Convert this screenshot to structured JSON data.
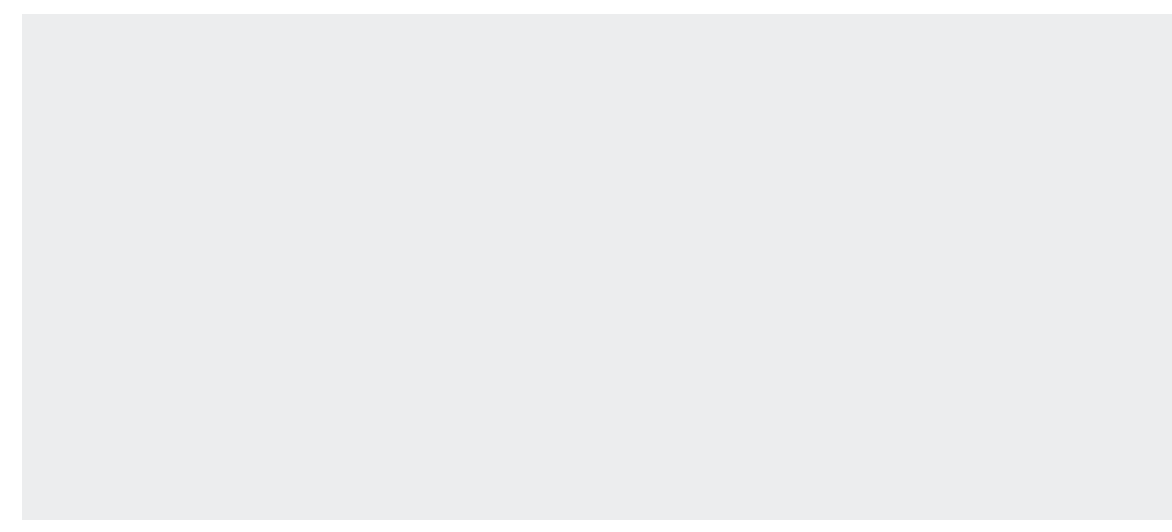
{
  "chart_data": {
    "type": "line",
    "title": "",
    "xlabel": "Hourly rate of pay",
    "ylabel": "Thousands",
    "ylim": [
      0,
      4000
    ],
    "yticks": [
      0,
      500,
      1000,
      1500,
      2000,
      2500,
      3000,
      3500,
      4000
    ],
    "ytick_labels": [
      "0",
      "500",
      "1,000",
      "1,500",
      "2,000",
      "2,500",
      "3,000",
      "3,500",
      "4,000"
    ],
    "x": [
      3.0,
      3.1,
      3.2,
      3.3,
      3.4,
      3.5,
      3.6,
      3.7,
      3.8,
      3.9,
      4.0,
      4.1,
      4.2,
      4.3,
      4.4,
      4.5
    ],
    "categories": [
      "£3.00",
      "£3.10",
      "£3.20",
      "£3.30",
      "£3.40",
      "£3.50",
      "£3.60",
      "£3.70",
      "£3.80",
      "£3.90",
      "£4.00",
      "£4.10",
      "£4.20",
      "£4.30",
      "£4.40",
      "£4.50"
    ],
    "grid": false,
    "legend_position": "top-left",
    "series": [
      {
        "name": "spring 1999",
        "style": "solid",
        "color": "#8c8c8c",
        "width": 6,
        "values": [
          190,
          230,
          265,
          300,
          340,
          385,
          420,
          560,
          1230,
          1480,
          1700,
          2040,
          2560,
          2620,
          2950,
          3300
        ]
      },
      {
        "name": "spring 2000",
        "style": "dashed-thin",
        "color": "#8c8c8c",
        "width": 3,
        "values": [
          120,
          135,
          150,
          160,
          170,
          185,
          200,
          230,
          780,
          900,
          1110,
          1320,
          1520,
          2040,
          2230,
          2480
        ]
      },
      {
        "name": "spring 2001",
        "style": "dashed-thick",
        "color": "#8c8c8c",
        "width": 6,
        "values": [
          110,
          118,
          125,
          132,
          140,
          150,
          160,
          185,
          250,
          560,
          790,
          950,
          1090,
          1500,
          1560,
          1760
        ]
      },
      {
        "name": "spring 2002",
        "style": "dash-dot",
        "color": "#8c8c8c",
        "width": 3,
        "values": [
          105,
          108,
          112,
          116,
          120,
          124,
          130,
          140,
          150,
          155,
          165,
          175,
          195,
          380,
          960,
          1180
        ]
      }
    ],
    "series_full": [
      {
        "name": "spring 1999",
        "points": [
          [
            3.0,
            190
          ],
          [
            3.1,
            230
          ],
          [
            3.2,
            265
          ],
          [
            3.3,
            300
          ],
          [
            3.4,
            340
          ],
          [
            3.5,
            385
          ],
          [
            3.55,
            420
          ],
          [
            3.6,
            560
          ],
          [
            3.7,
            1230
          ],
          [
            3.8,
            1480
          ],
          [
            3.9,
            1700
          ],
          [
            4.0,
            2040
          ],
          [
            4.05,
            2560
          ],
          [
            4.1,
            2620
          ],
          [
            4.2,
            2950
          ],
          [
            4.3,
            3300
          ],
          [
            4.4,
            3640
          ],
          [
            4.5,
            3975
          ]
        ]
      },
      {
        "name": "spring 2000",
        "points": [
          [
            3.0,
            120
          ],
          [
            3.1,
            135
          ],
          [
            3.2,
            150
          ],
          [
            3.3,
            160
          ],
          [
            3.4,
            170
          ],
          [
            3.5,
            185
          ],
          [
            3.55,
            200
          ],
          [
            3.6,
            230
          ],
          [
            3.7,
            780
          ],
          [
            3.8,
            900
          ],
          [
            3.9,
            1110
          ],
          [
            4.0,
            1320
          ],
          [
            4.02,
            1520
          ],
          [
            4.1,
            2040
          ],
          [
            4.2,
            2230
          ],
          [
            4.3,
            2480
          ],
          [
            4.4,
            2880
          ],
          [
            4.5,
            3340
          ]
        ]
      },
      {
        "name": "spring 2001",
        "points": [
          [
            3.0,
            110
          ],
          [
            3.1,
            118
          ],
          [
            3.2,
            125
          ],
          [
            3.3,
            132
          ],
          [
            3.4,
            140
          ],
          [
            3.5,
            150
          ],
          [
            3.6,
            160
          ],
          [
            3.65,
            185
          ],
          [
            3.7,
            250
          ],
          [
            3.8,
            560
          ],
          [
            3.9,
            790
          ],
          [
            4.0,
            950
          ],
          [
            4.05,
            1090
          ],
          [
            4.1,
            1500
          ],
          [
            4.2,
            1560
          ],
          [
            4.3,
            1760
          ],
          [
            4.4,
            2150
          ],
          [
            4.5,
            2600
          ]
        ]
      },
      {
        "name": "spring 2002",
        "points": [
          [
            3.0,
            105
          ],
          [
            3.1,
            108
          ],
          [
            3.2,
            112
          ],
          [
            3.3,
            116
          ],
          [
            3.4,
            120
          ],
          [
            3.5,
            124
          ],
          [
            3.6,
            130
          ],
          [
            3.7,
            140
          ],
          [
            3.8,
            150
          ],
          [
            3.9,
            155
          ],
          [
            4.0,
            165
          ],
          [
            4.05,
            195
          ],
          [
            4.1,
            380
          ],
          [
            4.15,
            960
          ],
          [
            4.2,
            1180
          ],
          [
            4.3,
            1360
          ],
          [
            4.4,
            1620
          ],
          [
            4.5,
            1950
          ]
        ]
      }
    ],
    "annotations": [
      {
        "id": "threshold-1999-2000",
        "lines": [
          "Minimum wage",
          "threshold for",
          "1999 and 2000"
        ],
        "x_value": 3.595,
        "align": "right"
      },
      {
        "id": "threshold-2001",
        "lines": [
          "Minimum wage",
          "threshold for",
          "2001"
        ],
        "x_value": 3.695,
        "align": "left"
      },
      {
        "id": "threshold-2002",
        "lines": [
          "Minimum wage",
          "threshold for",
          "2002"
        ],
        "x_value": 4.105,
        "align": "left"
      }
    ]
  },
  "legend": {
    "items": [
      {
        "label": "spring 1999"
      },
      {
        "label": "spring 2000"
      },
      {
        "label": "spring 2001"
      },
      {
        "label": "spring 2002"
      }
    ]
  },
  "axes": {
    "ylabel": "Thousands",
    "xlabel": "Hourly rate of pay"
  },
  "colors": {
    "panel_background": "#ecedee",
    "page_background": "#ffffff",
    "line": "#8c8c8c",
    "axis": "#1c1c1c",
    "text": "#2b2b2b"
  }
}
